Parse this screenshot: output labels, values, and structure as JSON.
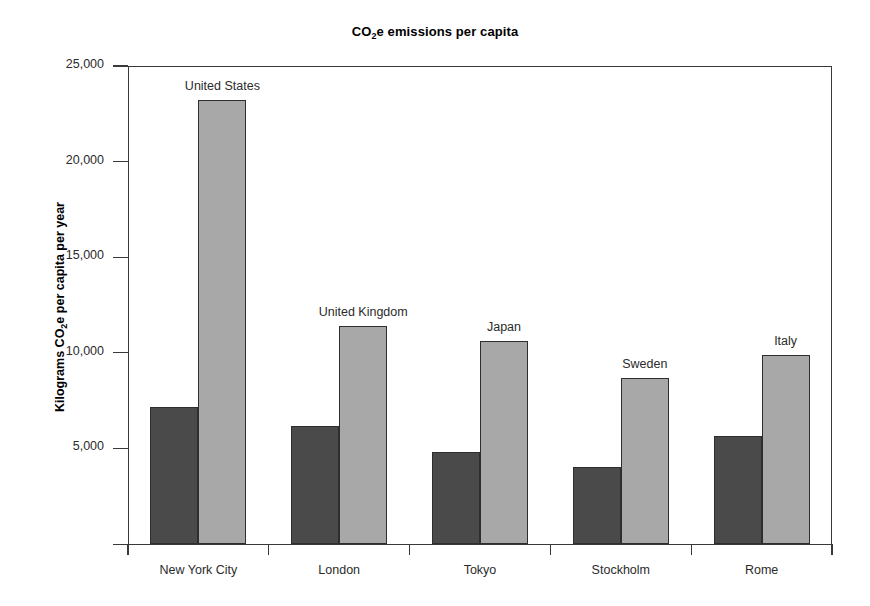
{
  "chart_data": {
    "type": "bar",
    "title": "CO2e emissions per capita",
    "title_prefix": "CO",
    "title_sub": "2",
    "title_suffix": "e emissions per capita",
    "xlabel": "",
    "ylabel": "Kilograms CO2e per capita per year",
    "ylabel_prefix": "Kilograms CO",
    "ylabel_sub": "2",
    "ylabel_suffix": "e per capita per year",
    "ylim": [
      0,
      25000
    ],
    "ytick_labels": [
      "25,000",
      "20,000",
      "15,000",
      "10,000",
      "5,000"
    ],
    "ytick_values": [
      25000,
      20000,
      15000,
      10000,
      5000
    ],
    "grid": false,
    "legend": "none",
    "categories": [
      "New York City",
      "London",
      "Tokyo",
      "Stockholm",
      "Rome"
    ],
    "annotations": [
      "United States",
      "United Kingdom",
      "Japan",
      "Sweden",
      "Italy"
    ],
    "series": [
      {
        "name": "City",
        "color": "#4a4a4a",
        "values": [
          7150,
          6160,
          4800,
          4020,
          5640
        ]
      },
      {
        "name": "Country",
        "color": "#a8a8a8",
        "values": [
          23230,
          11380,
          10600,
          8660,
          9860
        ]
      }
    ]
  },
  "colors": {
    "city_bar": "#4a4a4a",
    "country_bar": "#a8a8a8",
    "axis": "#3a3a3a",
    "background": "#ffffff",
    "text": "#2b2b2b"
  }
}
